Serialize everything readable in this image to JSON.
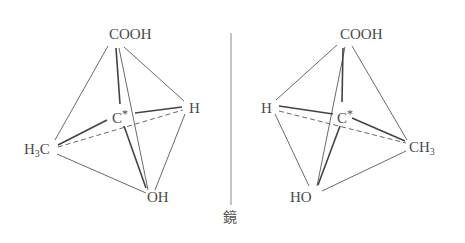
{
  "diagram": {
    "type": "enantiomer-mirror-image",
    "mirror_label": "鏡",
    "left_molecule": {
      "center": {
        "text": "C",
        "mark": "*"
      },
      "top": "COOH",
      "right": "H",
      "left": {
        "main": "H",
        "sub": "3",
        "tail": "C"
      },
      "bottom": "OH"
    },
    "right_molecule": {
      "center": {
        "text": "C",
        "mark": "*"
      },
      "top": "COOH",
      "left": "H",
      "right": {
        "main": "CH",
        "sub": "3"
      },
      "bottom": "HO"
    },
    "colors": {
      "line": "#6a6a6a",
      "bond": "#444444",
      "text": "#4a4a4a"
    }
  }
}
